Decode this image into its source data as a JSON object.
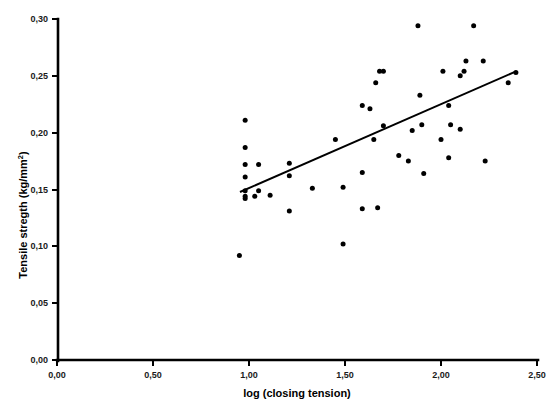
{
  "chart_data": {
    "type": "scatter",
    "title": "",
    "xlabel": "log (closing tension)",
    "ylabel": "Tensile stregth (kg/mm",
    "ylabel_superscript": "2",
    "ylabel_suffix": ")",
    "xlim": [
      0.0,
      2.5
    ],
    "ylim": [
      0.0,
      0.3
    ],
    "grid": false,
    "legend": null,
    "decimal_separator": ",",
    "xticks": [
      0.0,
      0.5,
      1.0,
      1.5,
      2.0,
      2.5
    ],
    "xtick_labels": [
      "0,00",
      "0,50",
      "1,00",
      "1,50",
      "2,00",
      "2,50"
    ],
    "yticks": [
      0.0,
      0.05,
      0.1,
      0.15,
      0.2,
      0.25,
      0.3
    ],
    "ytick_labels": [
      "0,00",
      "0,05",
      "0,10",
      "0,15",
      "0,20",
      "0,25",
      "0,30"
    ],
    "marker": "filled-circle",
    "marker_color": "#000000",
    "marker_size_px": 5,
    "points": [
      {
        "x": 0.98,
        "y": 0.211
      },
      {
        "x": 0.98,
        "y": 0.187
      },
      {
        "x": 0.98,
        "y": 0.172
      },
      {
        "x": 1.05,
        "y": 0.172
      },
      {
        "x": 0.98,
        "y": 0.161
      },
      {
        "x": 0.98,
        "y": 0.149
      },
      {
        "x": 1.05,
        "y": 0.149
      },
      {
        "x": 1.11,
        "y": 0.145
      },
      {
        "x": 0.98,
        "y": 0.142
      },
      {
        "x": 0.98,
        "y": 0.144
      },
      {
        "x": 1.03,
        "y": 0.144
      },
      {
        "x": 0.95,
        "y": 0.092
      },
      {
        "x": 1.21,
        "y": 0.173
      },
      {
        "x": 1.21,
        "y": 0.162
      },
      {
        "x": 1.21,
        "y": 0.131
      },
      {
        "x": 1.33,
        "y": 0.151
      },
      {
        "x": 1.49,
        "y": 0.152
      },
      {
        "x": 1.49,
        "y": 0.102
      },
      {
        "x": 1.45,
        "y": 0.194
      },
      {
        "x": 1.59,
        "y": 0.165
      },
      {
        "x": 1.59,
        "y": 0.133
      },
      {
        "x": 1.63,
        "y": 0.221
      },
      {
        "x": 1.65,
        "y": 0.194
      },
      {
        "x": 1.67,
        "y": 0.134
      },
      {
        "x": 1.68,
        "y": 0.254
      },
      {
        "x": 1.7,
        "y": 0.254
      },
      {
        "x": 1.66,
        "y": 0.244
      },
      {
        "x": 1.59,
        "y": 0.224
      },
      {
        "x": 1.7,
        "y": 0.206
      },
      {
        "x": 1.78,
        "y": 0.18
      },
      {
        "x": 1.83,
        "y": 0.175
      },
      {
        "x": 1.88,
        "y": 0.294
      },
      {
        "x": 1.89,
        "y": 0.233
      },
      {
        "x": 1.85,
        "y": 0.202
      },
      {
        "x": 1.9,
        "y": 0.207
      },
      {
        "x": 1.91,
        "y": 0.164
      },
      {
        "x": 2.01,
        "y": 0.254
      },
      {
        "x": 2.04,
        "y": 0.224
      },
      {
        "x": 2.05,
        "y": 0.207
      },
      {
        "x": 2.0,
        "y": 0.194
      },
      {
        "x": 2.04,
        "y": 0.178
      },
      {
        "x": 2.13,
        "y": 0.263
      },
      {
        "x": 2.17,
        "y": 0.294
      },
      {
        "x": 2.22,
        "y": 0.263
      },
      {
        "x": 2.12,
        "y": 0.254
      },
      {
        "x": 2.1,
        "y": 0.203
      },
      {
        "x": 2.23,
        "y": 0.175
      },
      {
        "x": 2.35,
        "y": 0.244
      },
      {
        "x": 2.39,
        "y": 0.253
      },
      {
        "x": 2.1,
        "y": 0.25
      }
    ],
    "fit_line": {
      "label": "linear regression line",
      "x_start": 0.953,
      "y_start": 0.1478,
      "x_end": 2.385,
      "y_end": 0.2535
    }
  }
}
